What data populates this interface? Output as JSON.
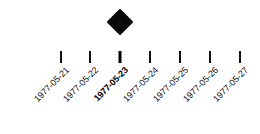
{
  "figure": {
    "title": "",
    "background_color": "#ffffff",
    "width": 260,
    "height": 134
  },
  "chart_data": {
    "type": "scatter",
    "title": "",
    "subtitle": "",
    "xlabel": "",
    "ylabel": "",
    "orientation": "horizontal-timeline",
    "grid": false,
    "legend": null,
    "marker": {
      "shape": "diamond",
      "color": "#000000",
      "size_px": 27,
      "filled": true
    },
    "axis": {
      "tick_rotation_degrees": -45,
      "tick_label_color": "#111111",
      "tick_color": "#0f0f0f"
    },
    "categories": [
      "1977-05-21",
      "1977-05-22",
      "1977-05-23",
      "1977-05-24",
      "1977-05-25",
      "1977-05-26",
      "1977-05-27"
    ],
    "highlighted_category": "1977-05-23",
    "values": [
      0,
      0,
      1,
      0,
      0,
      0,
      0
    ],
    "points": [
      {
        "x": "1977-05-23",
        "y": 1,
        "marker": "diamond"
      }
    ]
  },
  "axis_ticks": [
    {
      "label": "1977-05-21",
      "x": 61,
      "highlight": false,
      "has_marker": false
    },
    {
      "label": "1977-05-22",
      "x": 90,
      "highlight": false,
      "has_marker": false
    },
    {
      "label": "1977-05-23",
      "x": 120,
      "highlight": true,
      "has_marker": true
    },
    {
      "label": "1977-05-24",
      "x": 150,
      "highlight": false,
      "has_marker": false
    },
    {
      "label": "1977-05-25",
      "x": 180,
      "highlight": false,
      "has_marker": false
    },
    {
      "label": "1977-05-26",
      "x": 210,
      "highlight": false,
      "has_marker": false
    },
    {
      "label": "1977-05-27",
      "x": 240,
      "highlight": false,
      "has_marker": false
    }
  ],
  "markers": [
    {
      "name": "event-diamond",
      "x": 120,
      "y": 22,
      "label": "1977-05-23"
    }
  ]
}
